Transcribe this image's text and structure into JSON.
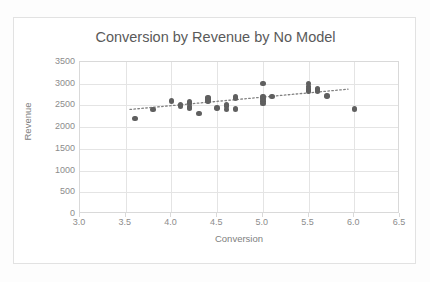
{
  "page": {
    "background_color": "#fdfdfd",
    "ghost_text_top": "",
    "ghost_text_bottom": ""
  },
  "chart_data": {
    "type": "scatter",
    "title": "Conversion by Revenue by No Model",
    "xlabel": "Conversion",
    "ylabel": "Revenue",
    "xlim": [
      3.0,
      6.5
    ],
    "ylim": [
      0,
      3500
    ],
    "xticks": [
      "3.0",
      "3.5",
      "4.0",
      "4.5",
      "5.0",
      "5.5",
      "6.0",
      "6.5"
    ],
    "yticks": [
      "0",
      "500",
      "1000",
      "1500",
      "2000",
      "2500",
      "3000",
      "3500"
    ],
    "xtick_values": [
      3.0,
      3.5,
      4.0,
      4.5,
      5.0,
      5.5,
      6.0,
      6.5
    ],
    "ytick_values": [
      0,
      500,
      1000,
      1500,
      2000,
      2500,
      3000,
      3500
    ],
    "grid": true,
    "legend": null,
    "marker_color": "#5f5f5f",
    "marker_size": 5.4,
    "title_color": "#5a5a5a",
    "tick_color": "#8c8c8c",
    "grid_color": "#e4e4e4",
    "series": [
      {
        "name": "Revenue vs Conversion",
        "points": [
          [
            3.6,
            2200
          ],
          [
            3.8,
            2410
          ],
          [
            4.0,
            2605
          ],
          [
            4.1,
            2520
          ],
          [
            4.1,
            2490
          ],
          [
            4.2,
            2580
          ],
          [
            4.2,
            2545
          ],
          [
            4.2,
            2465
          ],
          [
            4.2,
            2430
          ],
          [
            4.3,
            2315
          ],
          [
            4.4,
            2680
          ],
          [
            4.4,
            2645
          ],
          [
            4.4,
            2600
          ],
          [
            4.5,
            2440
          ],
          [
            4.6,
            2410
          ],
          [
            4.6,
            2520
          ],
          [
            4.6,
            2490
          ],
          [
            4.7,
            2690
          ],
          [
            4.7,
            2655
          ],
          [
            4.7,
            2415
          ],
          [
            5.0,
            3010
          ],
          [
            5.0,
            2700
          ],
          [
            5.0,
            2660
          ],
          [
            5.0,
            2600
          ],
          [
            5.0,
            2545
          ],
          [
            5.1,
            2700
          ],
          [
            5.5,
            3000
          ],
          [
            5.5,
            2930
          ],
          [
            5.5,
            2880
          ],
          [
            5.5,
            2830
          ],
          [
            5.6,
            2890
          ],
          [
            5.6,
            2855
          ],
          [
            5.6,
            2820
          ],
          [
            5.7,
            2720
          ],
          [
            6.0,
            2420
          ]
        ]
      }
    ],
    "trendline": {
      "style": "dotted",
      "color": "#808080",
      "x_start": 3.55,
      "y_start": 2400,
      "x_end": 5.95,
      "y_end": 2870
    }
  }
}
